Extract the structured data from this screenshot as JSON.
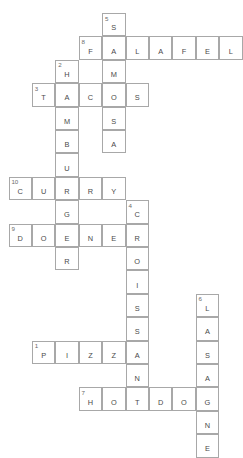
{
  "puzzle": {
    "title": "Food Crossword",
    "grid": {
      "cell_size": 23.4,
      "origin_x": 8.6,
      "origin_y": 13.0,
      "columns": 10,
      "rows": 17
    },
    "answers": [
      {
        "number": "1",
        "text": "PIZZA",
        "direction": "across",
        "row": 12,
        "col": 1
      },
      {
        "number": "2",
        "text": "HAMBURGER",
        "direction": "down",
        "row": 2,
        "col": 2
      },
      {
        "number": "3",
        "text": "TACOS",
        "direction": "across",
        "row": 3,
        "col": 1
      },
      {
        "number": "4",
        "text": "CROISSANT",
        "direction": "down",
        "row": 7,
        "col": 5
      },
      {
        "number": "5",
        "text": "SAMOSA",
        "direction": "down",
        "row": 0,
        "col": 4
      },
      {
        "number": "6",
        "text": "LASAGNE",
        "direction": "down",
        "row": 11,
        "col": 7
      },
      {
        "number": "7",
        "text": "HOTDOG",
        "direction": "across",
        "row": 14,
        "col": 3
      },
      {
        "number": "8",
        "text": "FALAFEL",
        "direction": "across",
        "row": 1,
        "col": 3
      },
      {
        "number": "9",
        "text": "DONER",
        "direction": "across",
        "row": 8,
        "col": 0
      },
      {
        "number": "10",
        "text": "CURRY",
        "direction": "across",
        "row": 6,
        "col": 0
      }
    ],
    "cells": [
      {
        "row": 0,
        "col": 4,
        "letter": "S",
        "clue": "5"
      },
      {
        "row": 1,
        "col": 3,
        "letter": "F",
        "clue": "8"
      },
      {
        "row": 1,
        "col": 4,
        "letter": "A",
        "clue": ""
      },
      {
        "row": 1,
        "col": 5,
        "letter": "L",
        "clue": ""
      },
      {
        "row": 1,
        "col": 6,
        "letter": "A",
        "clue": ""
      },
      {
        "row": 1,
        "col": 7,
        "letter": "F",
        "clue": ""
      },
      {
        "row": 1,
        "col": 8,
        "letter": "E",
        "clue": ""
      },
      {
        "row": 1,
        "col": 9,
        "letter": "L",
        "clue": ""
      },
      {
        "row": 2,
        "col": 2,
        "letter": "H",
        "clue": "2"
      },
      {
        "row": 2,
        "col": 4,
        "letter": "M",
        "clue": ""
      },
      {
        "row": 3,
        "col": 1,
        "letter": "T",
        "clue": "3"
      },
      {
        "row": 3,
        "col": 2,
        "letter": "A",
        "clue": ""
      },
      {
        "row": 3,
        "col": 3,
        "letter": "C",
        "clue": ""
      },
      {
        "row": 3,
        "col": 4,
        "letter": "O",
        "clue": ""
      },
      {
        "row": 3,
        "col": 5,
        "letter": "S",
        "clue": ""
      },
      {
        "row": 4,
        "col": 2,
        "letter": "M",
        "clue": ""
      },
      {
        "row": 4,
        "col": 4,
        "letter": "S",
        "clue": ""
      },
      {
        "row": 5,
        "col": 2,
        "letter": "B",
        "clue": ""
      },
      {
        "row": 5,
        "col": 4,
        "letter": "A",
        "clue": ""
      },
      {
        "row": 6,
        "col": 2,
        "letter": "U",
        "clue": ""
      },
      {
        "row": 7,
        "col": 0,
        "letter": "C",
        "clue": "10"
      },
      {
        "row": 7,
        "col": 1,
        "letter": "U",
        "clue": ""
      },
      {
        "row": 7,
        "col": 2,
        "letter": "R",
        "clue": ""
      },
      {
        "row": 7,
        "col": 3,
        "letter": "R",
        "clue": ""
      },
      {
        "row": 7,
        "col": 4,
        "letter": "Y",
        "clue": ""
      },
      {
        "row": 8,
        "col": 2,
        "letter": "G",
        "clue": ""
      },
      {
        "row": 8,
        "col": 5,
        "letter": "C",
        "clue": "4"
      },
      {
        "row": 9,
        "col": 0,
        "letter": "D",
        "clue": "9"
      },
      {
        "row": 9,
        "col": 1,
        "letter": "O",
        "clue": ""
      },
      {
        "row": 9,
        "col": 2,
        "letter": "E",
        "clue": ""
      },
      {
        "row": 9,
        "col": 3,
        "letter": "N",
        "clue": ""
      },
      {
        "row": 9,
        "col": 4,
        "letter": "E",
        "clue": ""
      },
      {
        "row": 9,
        "col": 5,
        "letter": "R",
        "clue": ""
      },
      {
        "row": 10,
        "col": 2,
        "letter": "R",
        "clue": ""
      },
      {
        "row": 10,
        "col": 5,
        "letter": "O",
        "clue": ""
      },
      {
        "row": 11,
        "col": 5,
        "letter": "I",
        "clue": ""
      },
      {
        "row": 12,
        "col": 5,
        "letter": "S",
        "clue": ""
      },
      {
        "row": 12,
        "col": 8,
        "letter": "L",
        "clue": "6"
      },
      {
        "row": 13,
        "col": 5,
        "letter": "S",
        "clue": ""
      },
      {
        "row": 13,
        "col": 8,
        "letter": "A",
        "clue": ""
      },
      {
        "row": 14,
        "col": 1,
        "letter": "P",
        "clue": "1"
      },
      {
        "row": 14,
        "col": 2,
        "letter": "I",
        "clue": ""
      },
      {
        "row": 14,
        "col": 3,
        "letter": "Z",
        "clue": ""
      },
      {
        "row": 14,
        "col": 4,
        "letter": "Z",
        "clue": ""
      },
      {
        "row": 14,
        "col": 5,
        "letter": "A",
        "clue": ""
      },
      {
        "row": 14,
        "col": 8,
        "letter": "S",
        "clue": ""
      },
      {
        "row": 15,
        "col": 5,
        "letter": "N",
        "clue": ""
      },
      {
        "row": 15,
        "col": 8,
        "letter": "A",
        "clue": ""
      },
      {
        "row": 16,
        "col": 3,
        "letter": "H",
        "clue": "7"
      },
      {
        "row": 16,
        "col": 4,
        "letter": "O",
        "clue": ""
      },
      {
        "row": 16,
        "col": 5,
        "letter": "T",
        "clue": ""
      },
      {
        "row": 16,
        "col": 6,
        "letter": "D",
        "clue": ""
      },
      {
        "row": 16,
        "col": 7,
        "letter": "O",
        "clue": ""
      },
      {
        "row": 16,
        "col": 8,
        "letter": "G",
        "clue": ""
      },
      {
        "row": 17,
        "col": 8,
        "letter": "N",
        "clue": ""
      },
      {
        "row": 18,
        "col": 8,
        "letter": "E",
        "clue": ""
      }
    ]
  }
}
